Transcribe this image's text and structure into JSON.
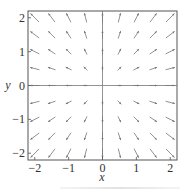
{
  "chart_data": {
    "type": "vector_field",
    "title": "",
    "xlabel": "x",
    "ylabel": "y",
    "xlim": [
      -2.2,
      2.2
    ],
    "ylim": [
      -2.2,
      2.2
    ],
    "xticks": [
      -2,
      -1,
      0,
      1,
      2
    ],
    "yticks": [
      -2,
      -1,
      0,
      1,
      2
    ],
    "xtick_labels": [
      "−2",
      "−1",
      "0",
      "1",
      "2"
    ],
    "ytick_labels": [
      "−2",
      "−1",
      "0",
      "1",
      "2"
    ],
    "grid": false,
    "axes_lines_through_origin": true,
    "field": {
      "u": "x",
      "v": "y",
      "description": "radial field pointing away from origin"
    },
    "sample_grid": {
      "x_start": -2,
      "x_end": 2,
      "y_start": -2,
      "y_end": 2,
      "step": 0.5
    },
    "arrow_color": "#777777",
    "frame_color": "#555555"
  },
  "labels": {
    "x_axis": "x",
    "y_axis": "y",
    "xticks": [
      "−2",
      "−1",
      "0",
      "1",
      "2"
    ],
    "yticks": [
      "2",
      "1",
      "0",
      "−1",
      "−2"
    ]
  }
}
